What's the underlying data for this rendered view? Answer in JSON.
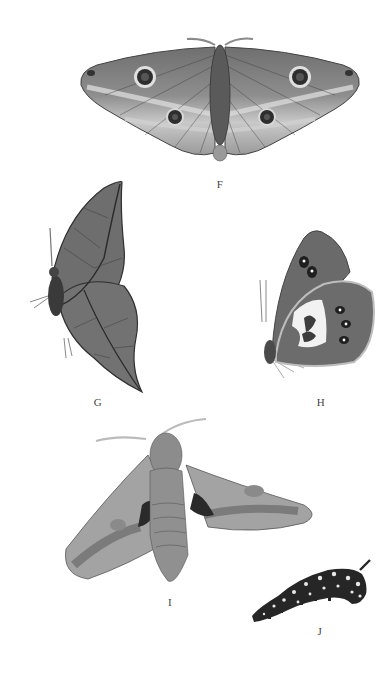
{
  "plate": {
    "background": "#ffffff",
    "ink_color": "#444444",
    "specimens": [
      {
        "id": "F",
        "label": "F",
        "description": "moth with spread wings, four eyespots",
        "colors": {
          "wing": "#8a8a8a",
          "band_light": "#cfcfcf",
          "vein": "#3a3a3a",
          "eyespot": "#2e2e2e",
          "body": "#5a5a5a"
        }
      },
      {
        "id": "G",
        "label": "G",
        "description": "leaf-mimic butterfly, wings closed, side view",
        "colors": {
          "wing": "#6e6e6e",
          "vein": "#2f2f2f",
          "body": "#3a3a3a"
        }
      },
      {
        "id": "H",
        "label": "H",
        "description": "butterfly, wings closed, side view with eyespots and white patch",
        "colors": {
          "wing": "#6a6a6a",
          "patch": "#f2f2f2",
          "eyespot": "#1f1f1f",
          "edge": "#bdbdbd"
        }
      },
      {
        "id": "I",
        "label": "I",
        "description": "hawk moth, wings spread, dorsal view",
        "colors": {
          "wing": "#a3a3a3",
          "band_dark": "#6a6a6a",
          "mark": "#2a2a2a",
          "body": "#8c8c8c"
        }
      },
      {
        "id": "J",
        "label": "J",
        "description": "caterpillar with spots and tail horn",
        "colors": {
          "body": "#262626",
          "spot": "#e8e8e8"
        }
      }
    ]
  }
}
